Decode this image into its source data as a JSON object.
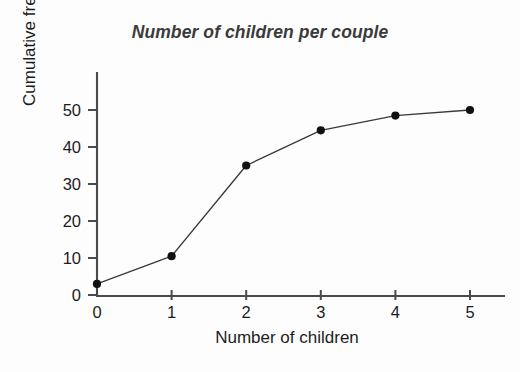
{
  "chart_data": {
    "type": "line",
    "title": "Number of children per couple",
    "xlabel": "Number of children",
    "ylabel": "Cumulative frequency",
    "x": [
      0,
      1,
      2,
      3,
      4,
      5
    ],
    "values": [
      3,
      10.5,
      35,
      44.5,
      48.5,
      50
    ],
    "series": [
      {
        "name": "Cumulative frequency",
        "values": [
          3,
          10.5,
          35,
          44.5,
          48.5,
          50
        ]
      }
    ],
    "xticks": [
      "0",
      "1",
      "2",
      "3",
      "4",
      "5"
    ],
    "yticks": [
      "0",
      "10",
      "20",
      "30",
      "40",
      "50"
    ],
    "xlim": [
      0,
      5
    ],
    "ylim": [
      0,
      50
    ],
    "grid": false,
    "legend": false,
    "marker": "filled-circle",
    "marker_color": "#111111",
    "line_color": "#3a3a3a",
    "axis_color": "#4a4a4a",
    "background_color": "#fdfdfd",
    "title_color": "#3b3b3b"
  }
}
